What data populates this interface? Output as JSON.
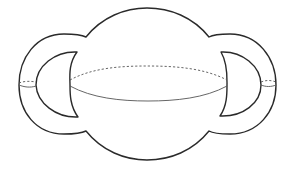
{
  "figure": {
    "colors": {
      "background": "#ffffff",
      "outline": "#2a2a2a",
      "equator": "#555555"
    },
    "parts": {
      "body": "sphere",
      "left_handle": "handle",
      "right_handle": "handle",
      "equator": "equator circle",
      "left_meridian": "handle cross-section",
      "right_meridian": "handle cross-section"
    }
  }
}
